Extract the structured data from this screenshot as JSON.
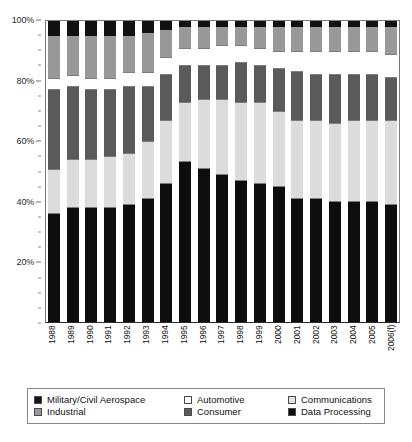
{
  "chart_data": {
    "type": "bar",
    "title": "",
    "xlabel": "",
    "ylabel": "",
    "ylim": [
      0,
      100
    ],
    "grid": false,
    "stacked": true,
    "stack_total": 100,
    "legend_position": "bottom",
    "categories": [
      "1988",
      "1989",
      "1990",
      "1991",
      "1992",
      "1993",
      "1994",
      "1995",
      "1996",
      "1997",
      "1998",
      "1999",
      "2000",
      "2001",
      "2002",
      "2003",
      "2004",
      "2005",
      "2006(f)"
    ],
    "ytick_labels": [
      "100%",
      "80%",
      "60%",
      "40%",
      "20%"
    ],
    "ytick_values": [
      100,
      80,
      60,
      40,
      20
    ],
    "stack_order_bottom_to_top": [
      "Data Processing",
      "Communications",
      "Consumer",
      "Automotive",
      "Industrial",
      "Military/Civil Aerospace"
    ],
    "series": [
      {
        "name": "Data Processing",
        "color": "#0d0d0d",
        "values": [
          36,
          38,
          38,
          38,
          39,
          41,
          46,
          53,
          51,
          49,
          47,
          46,
          45,
          41,
          41,
          40,
          40,
          40,
          39
        ]
      },
      {
        "name": "Communications",
        "color": "#dcdcdc",
        "values": [
          15,
          16,
          16,
          17,
          17,
          19,
          21,
          20,
          23,
          25,
          26,
          27,
          25,
          26,
          26,
          26,
          27,
          27,
          28
        ]
      },
      {
        "name": "Consumer",
        "color": "#5a5a5a",
        "values": [
          26,
          24,
          23,
          22,
          22,
          18,
          15,
          12,
          11,
          11,
          13,
          12,
          14,
          16,
          15,
          16,
          15,
          15,
          14
        ]
      },
      {
        "name": "Automotive",
        "color": "#ffffff",
        "values": [
          4,
          4,
          4,
          4,
          5,
          5,
          6,
          6,
          6,
          7,
          6,
          6,
          6,
          7,
          8,
          8,
          8,
          8,
          8
        ]
      },
      {
        "name": "Industrial",
        "color": "#999999",
        "values": [
          14,
          13,
          14,
          14,
          12,
          13,
          9,
          7,
          7,
          6,
          6,
          7,
          8,
          8,
          8,
          8,
          8,
          8,
          9
        ]
      },
      {
        "name": "Military/Civil Aerospace",
        "color": "#111111",
        "values": [
          5,
          5,
          5,
          5,
          5,
          4,
          3,
          2,
          2,
          2,
          2,
          2,
          2,
          2,
          2,
          2,
          2,
          2,
          2
        ]
      }
    ]
  },
  "legend": {
    "rows": [
      [
        {
          "label": "Military/Civil Aerospace",
          "color": "#111111"
        },
        {
          "label": "Automotive",
          "color": "#ffffff"
        },
        {
          "label": "Communications",
          "color": "#e4e4e4"
        }
      ],
      [
        {
          "label": "Industrial",
          "color": "#999999"
        },
        {
          "label": "Consumer",
          "color": "#5a5a5a"
        },
        {
          "label": "Data Processing",
          "color": "#0d0d0d"
        }
      ]
    ]
  }
}
